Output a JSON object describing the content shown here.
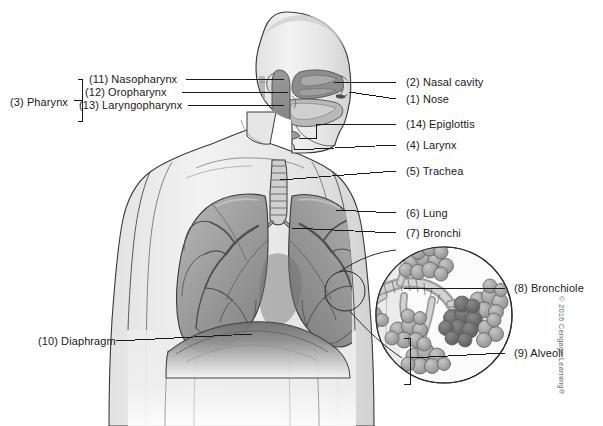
{
  "figure": {
    "background_color": "#ffffff",
    "line_color": "#1a1a1a",
    "text_color": "#1a1a1a",
    "copyright": "© 2016 Cengage Learning®"
  },
  "labels": {
    "pharynx_group": "(3) Pharynx",
    "nasopharynx": "(11) Nasopharynx",
    "oropharynx": "(12) Oropharynx",
    "laryngopharynx": "(13) Laryngopharynx",
    "nasal_cavity": "(2) Nasal cavity",
    "nose": "(1) Nose",
    "epiglottis": "(14) Epiglottis",
    "larynx": "(4) Larynx",
    "trachea": "(5) Trachea",
    "lung": "(6) Lung",
    "bronchi": "(7) Bronchi",
    "bronchiole": "(8) Bronchiole",
    "alveoli": "(9) Alveoli",
    "diaphragm": "(10) Diaphragm"
  },
  "structures": [
    {
      "number": 1,
      "name": "Nose",
      "side": "right"
    },
    {
      "number": 2,
      "name": "Nasal cavity",
      "side": "right"
    },
    {
      "number": 3,
      "name": "Pharynx",
      "side": "left"
    },
    {
      "number": 4,
      "name": "Larynx",
      "side": "right"
    },
    {
      "number": 5,
      "name": "Trachea",
      "side": "right"
    },
    {
      "number": 6,
      "name": "Lung",
      "side": "right"
    },
    {
      "number": 7,
      "name": "Bronchi",
      "side": "right"
    },
    {
      "number": 8,
      "name": "Bronchiole",
      "side": "right"
    },
    {
      "number": 9,
      "name": "Alveoli",
      "side": "right"
    },
    {
      "number": 10,
      "name": "Diaphragm",
      "side": "left"
    },
    {
      "number": 11,
      "name": "Nasopharynx",
      "side": "left"
    },
    {
      "number": 12,
      "name": "Oropharynx",
      "side": "left"
    },
    {
      "number": 13,
      "name": "Laryngopharynx",
      "side": "left"
    },
    {
      "number": 14,
      "name": "Epiglottis",
      "side": "right"
    }
  ]
}
